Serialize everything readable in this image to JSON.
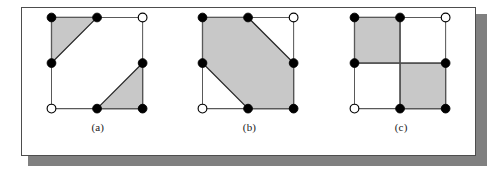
{
  "figure": {
    "background_color": "#ffffff",
    "card_border_color": "#4d4d4d",
    "shadow_color": "#808080",
    "fill_color": "#c8c8c8",
    "edge_color": "#595959",
    "shape_outline_color": "#262626",
    "node_filled_color": "#000000",
    "node_open_color": "#ffffff",
    "node_radius": 4.6,
    "grid": {
      "columns": 3,
      "rows": 3,
      "x_positions": [
        10,
        58,
        106
      ],
      "y_positions": [
        10,
        58,
        106
      ],
      "col_labels": [
        "left",
        "middle",
        "right"
      ],
      "row_labels": [
        "top",
        "middle",
        "bottom"
      ]
    },
    "panels": [
      {
        "id": "panel-a",
        "label": "(a)",
        "description": "Two shaded right triangles in opposite corners of a 3x3 lattice square",
        "lattice_edges": [
          {
            "from": [
              10,
              10
            ],
            "to": [
              58,
              10
            ]
          },
          {
            "from": [
              58,
              10
            ],
            "to": [
              106,
              10
            ]
          },
          {
            "from": [
              10,
              10
            ],
            "to": [
              10,
              58
            ]
          },
          {
            "from": [
              10,
              58
            ],
            "to": [
              10,
              106
            ]
          },
          {
            "from": [
              106,
              10
            ],
            "to": [
              106,
              58
            ]
          },
          {
            "from": [
              106,
              58
            ],
            "to": [
              106,
              106
            ]
          },
          {
            "from": [
              10,
              106
            ],
            "to": [
              58,
              106
            ]
          },
          {
            "from": [
              58,
              106
            ],
            "to": [
              106,
              106
            ]
          }
        ],
        "shaded_regions": [
          {
            "name": "top-left-triangle",
            "points": "10,10 58,10 10,58"
          },
          {
            "name": "bottom-right-triangle",
            "points": "58,106 106,58 106,106"
          }
        ],
        "nodes": [
          {
            "name": "node-top-left",
            "x": 10,
            "y": 10,
            "state": "filled"
          },
          {
            "name": "node-top-middle",
            "x": 58,
            "y": 10,
            "state": "filled"
          },
          {
            "name": "node-top-right",
            "x": 106,
            "y": 10,
            "state": "open"
          },
          {
            "name": "node-middle-left",
            "x": 10,
            "y": 58,
            "state": "filled"
          },
          {
            "name": "node-middle-right",
            "x": 106,
            "y": 58,
            "state": "filled"
          },
          {
            "name": "node-bottom-left",
            "x": 10,
            "y": 106,
            "state": "open"
          },
          {
            "name": "node-bottom-middle",
            "x": 58,
            "y": 106,
            "state": "filled"
          },
          {
            "name": "node-bottom-right",
            "x": 106,
            "y": 106,
            "state": "filled"
          }
        ]
      },
      {
        "id": "panel-b",
        "label": "(b)",
        "description": "One shaded hexagon covering most of the lattice square",
        "lattice_edges": [
          {
            "from": [
              10,
              10
            ],
            "to": [
              58,
              10
            ]
          },
          {
            "from": [
              58,
              10
            ],
            "to": [
              106,
              10
            ]
          },
          {
            "from": [
              10,
              10
            ],
            "to": [
              10,
              58
            ]
          },
          {
            "from": [
              10,
              58
            ],
            "to": [
              10,
              106
            ]
          },
          {
            "from": [
              106,
              10
            ],
            "to": [
              106,
              58
            ]
          },
          {
            "from": [
              106,
              58
            ],
            "to": [
              106,
              106
            ]
          },
          {
            "from": [
              10,
              106
            ],
            "to": [
              58,
              106
            ]
          },
          {
            "from": [
              58,
              106
            ],
            "to": [
              106,
              106
            ]
          }
        ],
        "shaded_regions": [
          {
            "name": "hexagon",
            "points": "10,10 58,10 106,58 106,106 58,106 10,58"
          }
        ],
        "nodes": [
          {
            "name": "node-top-left",
            "x": 10,
            "y": 10,
            "state": "filled"
          },
          {
            "name": "node-top-middle",
            "x": 58,
            "y": 10,
            "state": "filled"
          },
          {
            "name": "node-top-right",
            "x": 106,
            "y": 10,
            "state": "open"
          },
          {
            "name": "node-middle-left",
            "x": 10,
            "y": 58,
            "state": "filled"
          },
          {
            "name": "node-middle-right",
            "x": 106,
            "y": 58,
            "state": "filled"
          },
          {
            "name": "node-bottom-left",
            "x": 10,
            "y": 106,
            "state": "open"
          },
          {
            "name": "node-bottom-middle",
            "x": 58,
            "y": 106,
            "state": "filled"
          },
          {
            "name": "node-bottom-right",
            "x": 106,
            "y": 106,
            "state": "filled"
          }
        ]
      },
      {
        "id": "panel-c",
        "label": "(c)",
        "description": "Two shaded unit squares in opposite quadrants of the lattice square",
        "lattice_edges": [
          {
            "from": [
              10,
              10
            ],
            "to": [
              58,
              10
            ]
          },
          {
            "from": [
              58,
              10
            ],
            "to": [
              106,
              10
            ]
          },
          {
            "from": [
              10,
              10
            ],
            "to": [
              10,
              58
            ]
          },
          {
            "from": [
              10,
              58
            ],
            "to": [
              10,
              106
            ]
          },
          {
            "from": [
              106,
              10
            ],
            "to": [
              106,
              58
            ]
          },
          {
            "from": [
              106,
              58
            ],
            "to": [
              106,
              106
            ]
          },
          {
            "from": [
              10,
              106
            ],
            "to": [
              58,
              106
            ]
          },
          {
            "from": [
              58,
              106
            ],
            "to": [
              106,
              106
            ]
          },
          {
            "from": [
              58,
              10
            ],
            "to": [
              58,
              106
            ]
          },
          {
            "from": [
              10,
              58
            ],
            "to": [
              106,
              58
            ]
          }
        ],
        "shaded_regions": [
          {
            "name": "top-left-square",
            "points": "10,10 58,10 58,58 10,58"
          },
          {
            "name": "bottom-right-square",
            "points": "58,58 106,58 106,106 58,106"
          }
        ],
        "nodes": [
          {
            "name": "node-top-left",
            "x": 10,
            "y": 10,
            "state": "filled"
          },
          {
            "name": "node-top-middle",
            "x": 58,
            "y": 10,
            "state": "filled"
          },
          {
            "name": "node-top-right",
            "x": 106,
            "y": 10,
            "state": "open"
          },
          {
            "name": "node-middle-left",
            "x": 10,
            "y": 58,
            "state": "filled"
          },
          {
            "name": "node-middle-right",
            "x": 106,
            "y": 58,
            "state": "filled"
          },
          {
            "name": "node-bottom-left",
            "x": 10,
            "y": 106,
            "state": "open"
          },
          {
            "name": "node-bottom-middle",
            "x": 58,
            "y": 106,
            "state": "filled"
          },
          {
            "name": "node-bottom-right",
            "x": 106,
            "y": 106,
            "state": "filled"
          }
        ]
      }
    ]
  }
}
